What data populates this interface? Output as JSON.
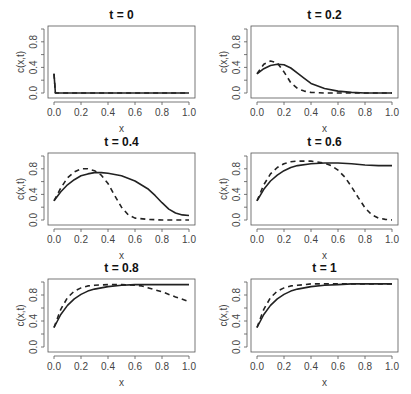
{
  "chart_data": [
    {
      "type": "line",
      "title": "t = 0",
      "xlabel": "x",
      "ylabel": "c(x,t)",
      "xlim": [
        0,
        1
      ],
      "ylim": [
        0,
        1
      ],
      "x_ticks": [
        "0.0",
        "0.2",
        "0.4",
        "0.6",
        "0.8",
        "1.0"
      ],
      "y_ticks": [
        "0.0",
        "0.4",
        "0.8"
      ],
      "grid": false,
      "series": [
        {
          "name": "solid",
          "style": "solid",
          "x": [
            0,
            0.01,
            0.02,
            0.1,
            0.5,
            1.0
          ],
          "values": [
            0.3,
            0.0,
            0.0,
            0.0,
            0.0,
            0.0
          ]
        },
        {
          "name": "dashed",
          "style": "dashed",
          "x": [
            0,
            0.01,
            0.02,
            0.1,
            0.5,
            1.0
          ],
          "values": [
            0.3,
            0.0,
            0.0,
            0.0,
            0.0,
            0.0
          ]
        }
      ]
    },
    {
      "type": "line",
      "title": "t = 0.2",
      "xlabel": "x",
      "ylabel": "c(x,t)",
      "xlim": [
        0,
        1
      ],
      "ylim": [
        0,
        1
      ],
      "x_ticks": [
        "0.0",
        "0.2",
        "0.4",
        "0.6",
        "0.8",
        "1.0"
      ],
      "y_ticks": [
        "0.0",
        "0.4",
        "0.8"
      ],
      "grid": false,
      "series": [
        {
          "name": "solid",
          "style": "solid",
          "x": [
            0,
            0.05,
            0.1,
            0.15,
            0.2,
            0.25,
            0.3,
            0.35,
            0.4,
            0.5,
            0.6,
            0.7,
            0.8,
            0.9,
            1.0
          ],
          "values": [
            0.3,
            0.38,
            0.43,
            0.45,
            0.44,
            0.39,
            0.31,
            0.23,
            0.15,
            0.07,
            0.03,
            0.01,
            0.0,
            0.0,
            0.0
          ]
        },
        {
          "name": "dashed",
          "style": "dashed",
          "x": [
            0,
            0.05,
            0.1,
            0.15,
            0.2,
            0.25,
            0.3,
            0.35,
            0.4,
            0.5,
            0.6,
            0.7,
            0.8,
            0.9,
            1.0
          ],
          "values": [
            0.3,
            0.45,
            0.5,
            0.47,
            0.33,
            0.16,
            0.07,
            0.03,
            0.01,
            0.0,
            0.0,
            0.0,
            0.0,
            0.0,
            0.0
          ]
        }
      ]
    },
    {
      "type": "line",
      "title": "t = 0.4",
      "xlabel": "x",
      "ylabel": "c(x,t)",
      "xlim": [
        0,
        1
      ],
      "ylim": [
        0,
        1
      ],
      "x_ticks": [
        "0.0",
        "0.2",
        "0.4",
        "0.6",
        "0.8",
        "1.0"
      ],
      "y_ticks": [
        "0.0",
        "0.4",
        "0.8"
      ],
      "grid": false,
      "series": [
        {
          "name": "solid",
          "style": "solid",
          "x": [
            0,
            0.05,
            0.1,
            0.15,
            0.2,
            0.25,
            0.3,
            0.35,
            0.4,
            0.5,
            0.6,
            0.7,
            0.75,
            0.8,
            0.85,
            0.9,
            0.95,
            1.0
          ],
          "values": [
            0.3,
            0.44,
            0.55,
            0.63,
            0.69,
            0.72,
            0.74,
            0.74,
            0.73,
            0.69,
            0.61,
            0.48,
            0.38,
            0.27,
            0.17,
            0.11,
            0.08,
            0.07
          ]
        },
        {
          "name": "dashed",
          "style": "dashed",
          "x": [
            0,
            0.05,
            0.1,
            0.15,
            0.2,
            0.25,
            0.3,
            0.35,
            0.4,
            0.45,
            0.5,
            0.55,
            0.6,
            0.7,
            0.8,
            0.9,
            1.0
          ],
          "values": [
            0.3,
            0.5,
            0.66,
            0.75,
            0.8,
            0.8,
            0.77,
            0.7,
            0.57,
            0.38,
            0.2,
            0.08,
            0.03,
            0.01,
            0.0,
            0.0,
            0.0
          ]
        }
      ]
    },
    {
      "type": "line",
      "title": "t = 0.6",
      "xlabel": "x",
      "ylabel": "c(x,t)",
      "xlim": [
        0,
        1
      ],
      "ylim": [
        0,
        1
      ],
      "x_ticks": [
        "0.0",
        "0.2",
        "0.4",
        "0.6",
        "0.8",
        "1.0"
      ],
      "y_ticks": [
        "0.0",
        "0.4",
        "0.8"
      ],
      "grid": false,
      "series": [
        {
          "name": "solid",
          "style": "solid",
          "x": [
            0,
            0.05,
            0.1,
            0.15,
            0.2,
            0.25,
            0.3,
            0.4,
            0.5,
            0.6,
            0.7,
            0.8,
            0.9,
            1.0
          ],
          "values": [
            0.3,
            0.48,
            0.61,
            0.7,
            0.77,
            0.82,
            0.85,
            0.88,
            0.89,
            0.89,
            0.88,
            0.86,
            0.85,
            0.85
          ]
        },
        {
          "name": "dashed",
          "style": "dashed",
          "x": [
            0,
            0.05,
            0.1,
            0.15,
            0.2,
            0.25,
            0.3,
            0.4,
            0.5,
            0.55,
            0.6,
            0.65,
            0.7,
            0.75,
            0.8,
            0.85,
            0.9,
            0.95,
            1.0
          ],
          "values": [
            0.3,
            0.55,
            0.72,
            0.82,
            0.88,
            0.91,
            0.92,
            0.92,
            0.89,
            0.85,
            0.78,
            0.67,
            0.52,
            0.35,
            0.19,
            0.08,
            0.03,
            0.01,
            0.0
          ]
        }
      ]
    },
    {
      "type": "line",
      "title": "t = 0.8",
      "xlabel": "x",
      "ylabel": "c(x,t)",
      "xlim": [
        0,
        1
      ],
      "ylim": [
        0,
        1
      ],
      "x_ticks": [
        "0.0",
        "0.2",
        "0.4",
        "0.6",
        "0.8",
        "1.0"
      ],
      "y_ticks": [
        "0.0",
        "0.4",
        "0.8"
      ],
      "grid": false,
      "series": [
        {
          "name": "solid",
          "style": "solid",
          "x": [
            0,
            0.05,
            0.1,
            0.15,
            0.2,
            0.25,
            0.3,
            0.4,
            0.5,
            0.6,
            0.7,
            0.8,
            0.9,
            1.0
          ],
          "values": [
            0.3,
            0.5,
            0.64,
            0.74,
            0.81,
            0.86,
            0.89,
            0.93,
            0.95,
            0.96,
            0.96,
            0.96,
            0.96,
            0.96
          ]
        },
        {
          "name": "dashed",
          "style": "dashed",
          "x": [
            0,
            0.05,
            0.1,
            0.15,
            0.2,
            0.25,
            0.3,
            0.4,
            0.5,
            0.6,
            0.65,
            0.7,
            0.8,
            0.9,
            1.0
          ],
          "values": [
            0.3,
            0.58,
            0.76,
            0.86,
            0.91,
            0.94,
            0.95,
            0.96,
            0.96,
            0.95,
            0.94,
            0.91,
            0.85,
            0.77,
            0.7
          ]
        }
      ]
    },
    {
      "type": "line",
      "title": "t = 1",
      "xlabel": "x",
      "ylabel": "c(x,t)",
      "xlim": [
        0,
        1
      ],
      "ylim": [
        0,
        1
      ],
      "x_ticks": [
        "0.0",
        "0.2",
        "0.4",
        "0.6",
        "0.8",
        "1.0"
      ],
      "y_ticks": [
        "0.0",
        "0.4",
        "0.8"
      ],
      "grid": false,
      "series": [
        {
          "name": "solid",
          "style": "solid",
          "x": [
            0,
            0.05,
            0.1,
            0.15,
            0.2,
            0.25,
            0.3,
            0.4,
            0.5,
            0.6,
            0.7,
            0.8,
            0.9,
            1.0
          ],
          "values": [
            0.3,
            0.5,
            0.64,
            0.74,
            0.81,
            0.86,
            0.89,
            0.93,
            0.95,
            0.96,
            0.97,
            0.97,
            0.97,
            0.97
          ]
        },
        {
          "name": "dashed",
          "style": "dashed",
          "x": [
            0,
            0.05,
            0.1,
            0.15,
            0.2,
            0.25,
            0.3,
            0.4,
            0.5,
            0.6,
            0.7,
            0.8,
            0.9,
            1.0
          ],
          "values": [
            0.3,
            0.58,
            0.76,
            0.86,
            0.91,
            0.94,
            0.95,
            0.97,
            0.97,
            0.97,
            0.97,
            0.97,
            0.97,
            0.97
          ]
        }
      ]
    }
  ],
  "layout": {
    "panels": [
      {
        "left": 48,
        "top": 26,
        "right": 195,
        "bottom": 98
      },
      {
        "left": 251,
        "top": 26,
        "right": 398,
        "bottom": 98
      },
      {
        "left": 48,
        "top": 153,
        "right": 195,
        "bottom": 225
      },
      {
        "left": 251,
        "top": 153,
        "right": 398,
        "bottom": 225
      },
      {
        "left": 48,
        "top": 279,
        "right": 195,
        "bottom": 352
      },
      {
        "left": 251,
        "top": 279,
        "right": 398,
        "bottom": 352
      }
    ],
    "line_color": "#222222",
    "axis_color": "#555555",
    "text_color": "#444444"
  }
}
